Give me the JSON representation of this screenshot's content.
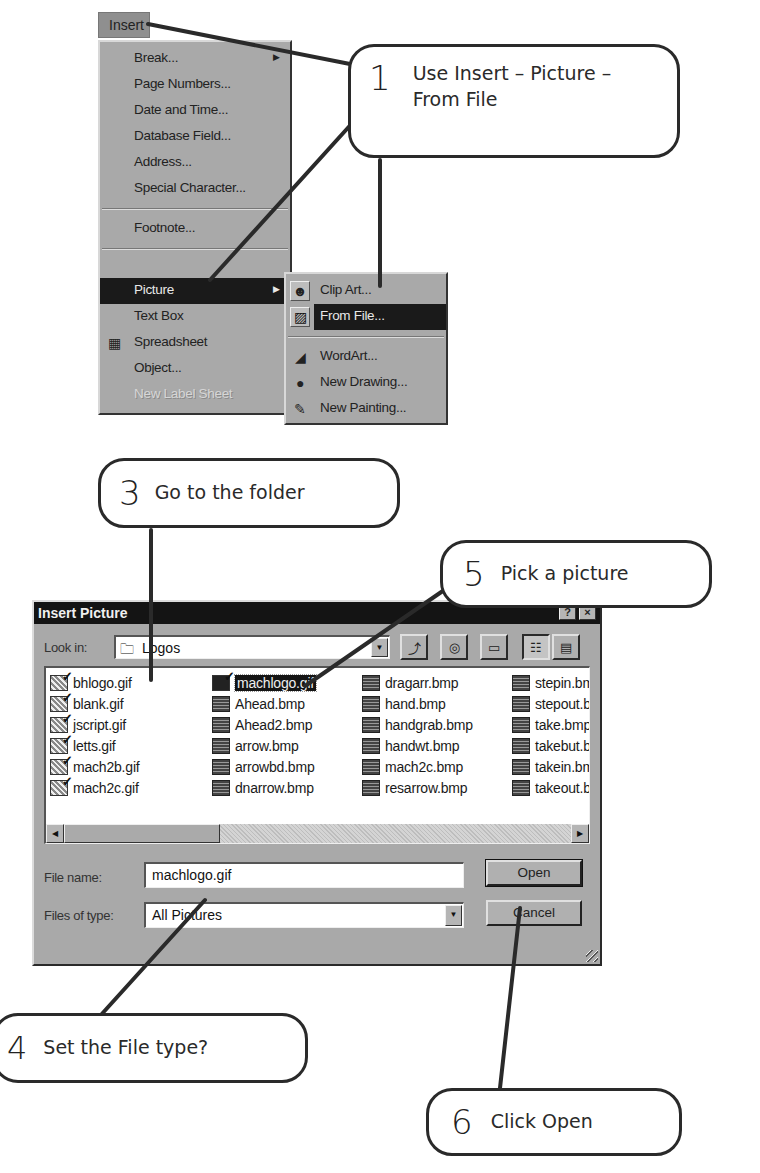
{
  "callouts": [
    {
      "num": "1",
      "text": "Use Insert – Picture – From File"
    },
    {
      "num": "3",
      "text": "Go to the folder"
    },
    {
      "num": "5",
      "text": "Pick a picture"
    },
    {
      "num": "4",
      "text": "Set the File type?"
    },
    {
      "num": "6",
      "text": "Click Open"
    }
  ],
  "menubar": {
    "active_item": "Insert"
  },
  "insert_menu": {
    "items": [
      {
        "label": "Break...",
        "submenu": true
      },
      {
        "label": "Page Numbers..."
      },
      {
        "label": "Date and Time..."
      },
      {
        "label": "Database Field..."
      },
      {
        "label": "Address..."
      },
      {
        "label": "Special Character..."
      },
      {
        "label": "Footnote..."
      },
      {
        "label": "Picture",
        "submenu": true,
        "selected": true
      },
      {
        "label": "Text Box"
      },
      {
        "label": "Spreadsheet",
        "icon": "spreadsheet-icon"
      },
      {
        "label": "Object..."
      },
      {
        "label": "New Label Sheet",
        "disabled": true
      }
    ]
  },
  "picture_submenu": {
    "items": [
      {
        "label": "Clip Art...",
        "icon": "clip-art-icon"
      },
      {
        "label": "From File...",
        "icon": "from-file-icon",
        "selected": true
      },
      {
        "label": "WordArt...",
        "icon": "wordart-icon"
      },
      {
        "label": "New Drawing...",
        "icon": "new-drawing-icon"
      },
      {
        "label": "New Painting...",
        "icon": "new-painting-icon"
      }
    ]
  },
  "dialog": {
    "title": "Insert Picture",
    "help_button": "?",
    "close_button": "×",
    "look_in_label": "Look in:",
    "look_in_value": "Logos",
    "toolbar": [
      "up-one-level-icon",
      "internet-icon",
      "new-folder-icon",
      "list-view-icon",
      "details-view-icon"
    ],
    "files": {
      "columns": [
        [
          {
            "name": "bhlogo.gif",
            "type": "gif"
          },
          {
            "name": "blank.gif",
            "type": "gif"
          },
          {
            "name": "jscript.gif",
            "type": "gif"
          },
          {
            "name": "letts.gif",
            "type": "gif"
          },
          {
            "name": "mach2b.gif",
            "type": "gif"
          },
          {
            "name": "mach2c.gif",
            "type": "gif"
          }
        ],
        [
          {
            "name": "machlogo.gif",
            "type": "gif",
            "selected": true
          },
          {
            "name": "Ahead.bmp",
            "type": "bmp"
          },
          {
            "name": "Ahead2.bmp",
            "type": "bmp"
          },
          {
            "name": "arrow.bmp",
            "type": "bmp"
          },
          {
            "name": "arrowbd.bmp",
            "type": "bmp"
          },
          {
            "name": "dnarrow.bmp",
            "type": "bmp"
          }
        ],
        [
          {
            "name": "dragarr.bmp",
            "type": "bmp"
          },
          {
            "name": "hand.bmp",
            "type": "bmp"
          },
          {
            "name": "handgrab.bmp",
            "type": "bmp"
          },
          {
            "name": "handwt.bmp",
            "type": "bmp"
          },
          {
            "name": "mach2c.bmp",
            "type": "bmp"
          },
          {
            "name": "resarrow.bmp",
            "type": "bmp"
          }
        ],
        [
          {
            "name": "stepin.bmp",
            "type": "bmp"
          },
          {
            "name": "stepout.bmp",
            "type": "bmp"
          },
          {
            "name": "take.bmp",
            "type": "bmp"
          },
          {
            "name": "takebut.bmp",
            "type": "bmp"
          },
          {
            "name": "takein.bmp",
            "type": "bmp"
          },
          {
            "name": "takeout.bmp",
            "type": "bmp"
          }
        ]
      ]
    },
    "file_name_label": "File name:",
    "file_name_value": "machlogo.gif",
    "file_type_label": "Files of type:",
    "file_type_value": "All Pictures",
    "open_button": "Open",
    "cancel_button": "Cancel"
  }
}
